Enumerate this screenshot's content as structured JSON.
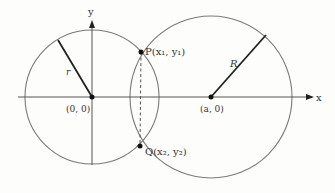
{
  "diagram": {
    "axes": {
      "x_label": "x",
      "y_label": "y"
    },
    "small_circle": {
      "center_label": "(0, 0)",
      "radius_label": "r"
    },
    "large_circle": {
      "center_label": "(a, 0)",
      "radius_label": "R"
    },
    "intersections": {
      "P_label": "P(x₁, y₁)",
      "Q_label": "Q(x₂, y₂)"
    },
    "colors": {
      "circle_stroke": "#7a7a7a",
      "line_stroke": "#222222",
      "axis_stroke": "#555555",
      "background": "#fdfdfb"
    }
  }
}
